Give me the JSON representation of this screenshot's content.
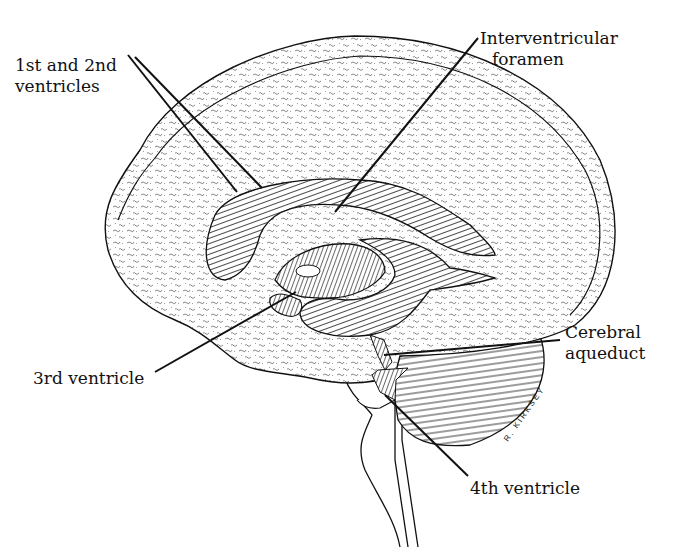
{
  "diagram": {
    "colors": {
      "ink": "#111111",
      "stipple": "#555555",
      "background": "#ffffff"
    },
    "labels": [
      {
        "id": "lateral",
        "lines": [
          "1st and 2nd",
          "ventricles"
        ]
      },
      {
        "id": "interventricular",
        "lines": [
          "Interventricular",
          "foramen"
        ]
      },
      {
        "id": "third",
        "lines": [
          "3rd ventricle"
        ]
      },
      {
        "id": "aqueduct",
        "lines": [
          "Cerebral",
          "aqueduct"
        ]
      },
      {
        "id": "fourth",
        "lines": [
          "4th ventricle"
        ]
      }
    ],
    "signature": "R. KIRKSEY"
  }
}
